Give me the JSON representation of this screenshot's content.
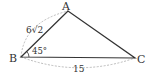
{
  "figure": {
    "type": "triangle",
    "vertices": {
      "A": {
        "label": "A",
        "x": 68,
        "y": 11
      },
      "B": {
        "label": "B",
        "x": 21,
        "y": 57
      },
      "C": {
        "label": "C",
        "x": 135,
        "y": 58
      }
    },
    "side_labels": {
      "AB": "6√2",
      "BC": "15"
    },
    "angle_labels": {
      "B": "45°"
    },
    "colors": {
      "stroke": "#333333",
      "dashed": "#aaaaaa",
      "text": "#333333"
    }
  }
}
